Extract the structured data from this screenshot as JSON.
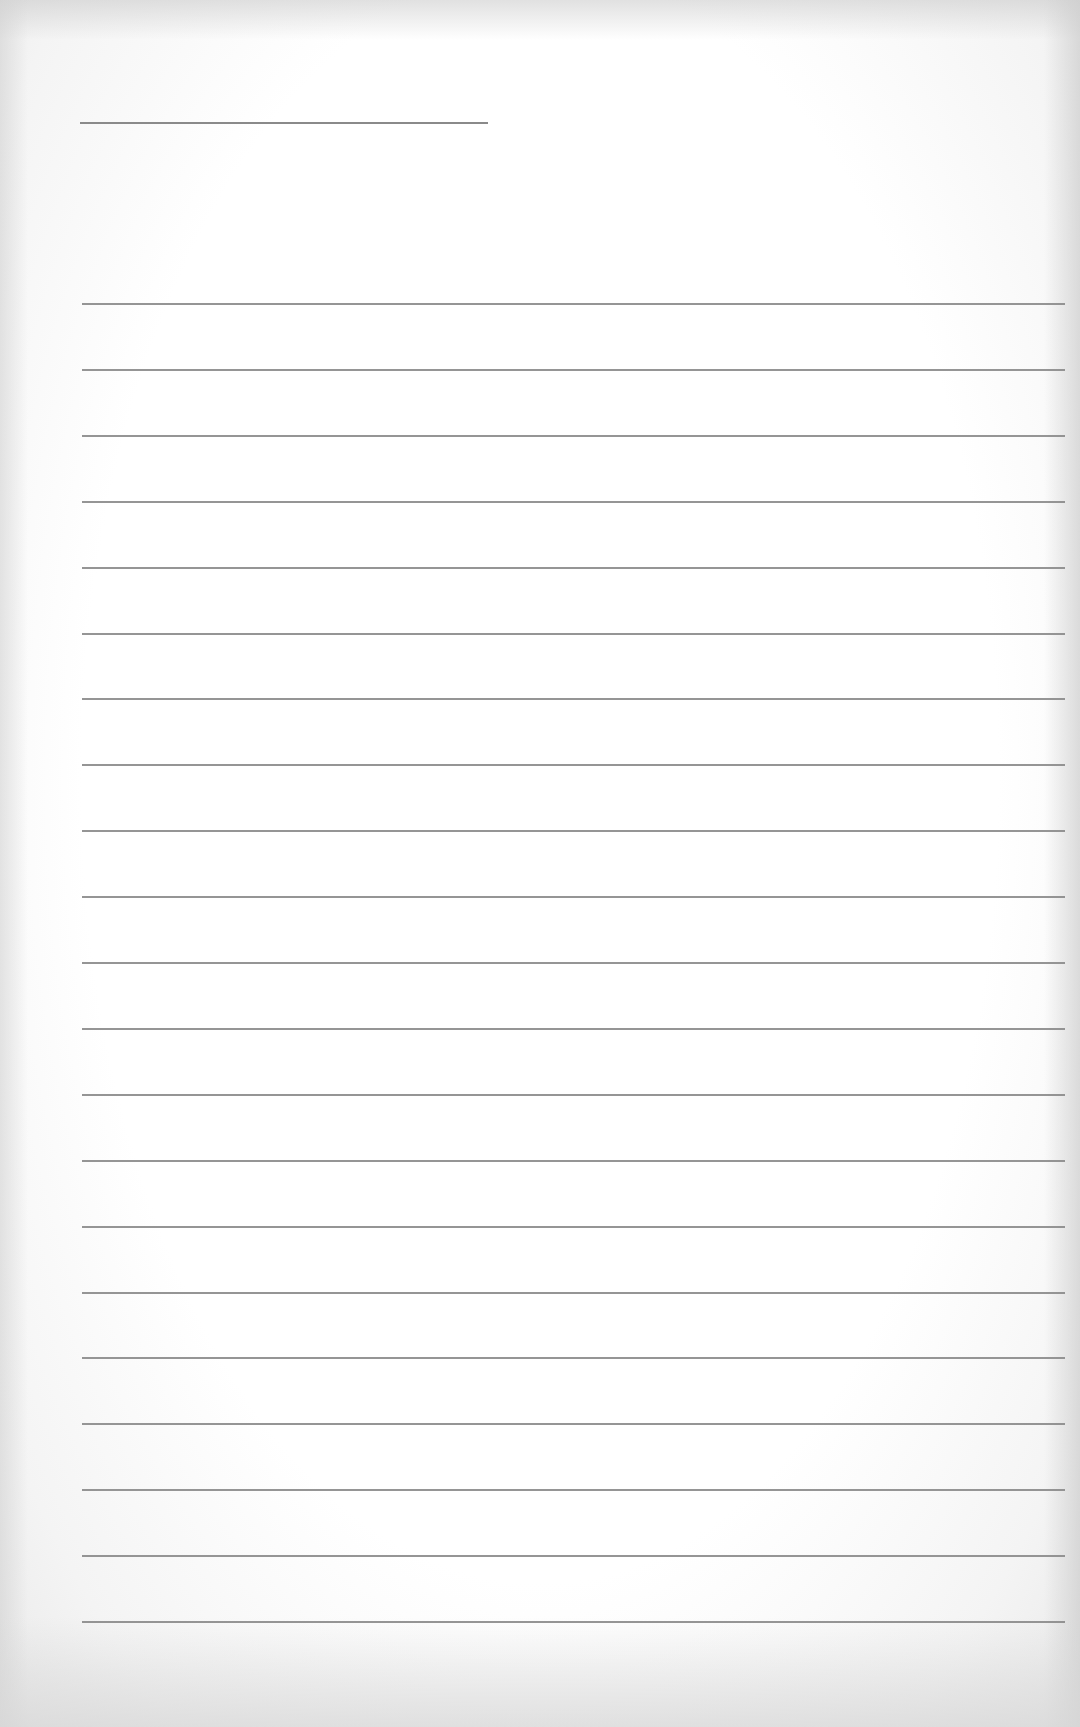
{
  "document": {
    "type": "lined-paper",
    "background_color": "#ffffff",
    "line_color": "#8a8a8a",
    "header_line": {
      "left": 80,
      "top": 122,
      "width": 408
    },
    "ruled_lines": {
      "count": 21,
      "first_top": 303,
      "spacing": 65.9,
      "left": 82,
      "width": 983
    },
    "text": []
  }
}
